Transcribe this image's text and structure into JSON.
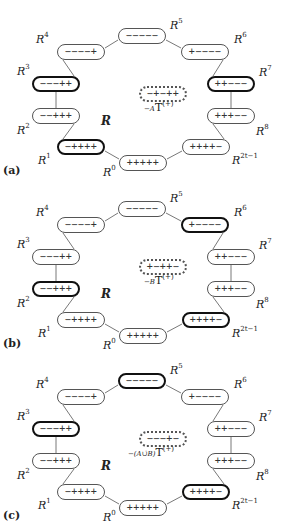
{
  "panels": [
    {
      "id": "a",
      "panel_label": "(a)",
      "center_label": "R",
      "target": {
        "signs": "−+−++",
        "subscript": "−A",
        "symbol": "T",
        "superscript": "(+)"
      },
      "nodes": {
        "R0": {
          "label": "R",
          "sup": "0",
          "signs": "+++++",
          "highlight": false
        },
        "R1": {
          "label": "R",
          "sup": "1",
          "signs": "−++++",
          "highlight": true
        },
        "R2": {
          "label": "R",
          "sup": "2",
          "signs": "−−+++",
          "highlight": false
        },
        "R3": {
          "label": "R",
          "sup": "3",
          "signs": "−−−++",
          "highlight": true
        },
        "R4": {
          "label": "R",
          "sup": "4",
          "signs": "−−−−+",
          "highlight": false
        },
        "R5": {
          "label": "R",
          "sup": "5",
          "signs": "−−−−−",
          "highlight": false
        },
        "R6": {
          "label": "R",
          "sup": "6",
          "signs": "+−−−−",
          "highlight": false
        },
        "R7": {
          "label": "R",
          "sup": "7",
          "signs": "++−−−",
          "highlight": true
        },
        "R8": {
          "label": "R",
          "sup": "8",
          "signs": "+++−−",
          "highlight": false
        },
        "R2t1": {
          "label": "R",
          "sup": "2t−1",
          "signs": "++++−",
          "highlight": false
        }
      }
    },
    {
      "id": "b",
      "panel_label": "(b)",
      "center_label": "R",
      "target": {
        "signs": "+−++−",
        "subscript": "−B",
        "symbol": "T",
        "superscript": "(+)"
      },
      "nodes": {
        "R0": {
          "label": "R",
          "sup": "0",
          "signs": "+++++",
          "highlight": false
        },
        "R1": {
          "label": "R",
          "sup": "1",
          "signs": "−++++",
          "highlight": false
        },
        "R2": {
          "label": "R",
          "sup": "2",
          "signs": "−−+++",
          "highlight": true
        },
        "R3": {
          "label": "R",
          "sup": "3",
          "signs": "−−−++",
          "highlight": false
        },
        "R4": {
          "label": "R",
          "sup": "4",
          "signs": "−−−−+",
          "highlight": false
        },
        "R5": {
          "label": "R",
          "sup": "5",
          "signs": "−−−−−",
          "highlight": false
        },
        "R6": {
          "label": "R",
          "sup": "6",
          "signs": "+−−−−",
          "highlight": true
        },
        "R7": {
          "label": "R",
          "sup": "7",
          "signs": "++−−−",
          "highlight": false
        },
        "R8": {
          "label": "R",
          "sup": "8",
          "signs": "+++−−",
          "highlight": false
        },
        "R2t1": {
          "label": "R",
          "sup": "2t−1",
          "signs": "++++−",
          "highlight": true
        }
      }
    },
    {
      "id": "c",
      "panel_label": "(c)",
      "center_label": "R",
      "target": {
        "signs": "−−−+−",
        "subscript": "−(A∪̇B)",
        "symbol": "T",
        "superscript": "(+)"
      },
      "nodes": {
        "R0": {
          "label": "R",
          "sup": "0",
          "signs": "+++++",
          "highlight": false
        },
        "R1": {
          "label": "R",
          "sup": "1",
          "signs": "−++++",
          "highlight": false
        },
        "R2": {
          "label": "R",
          "sup": "2",
          "signs": "−−+++",
          "highlight": false
        },
        "R3": {
          "label": "R",
          "sup": "3",
          "signs": "−−−++",
          "highlight": true
        },
        "R4": {
          "label": "R",
          "sup": "4",
          "signs": "−−−−+",
          "highlight": false
        },
        "R5": {
          "label": "R",
          "sup": "5",
          "signs": "−−−−−",
          "highlight": true
        },
        "R6": {
          "label": "R",
          "sup": "6",
          "signs": "+−−−−",
          "highlight": false
        },
        "R7": {
          "label": "R",
          "sup": "7",
          "signs": "++−−−",
          "highlight": false
        },
        "R8": {
          "label": "R",
          "sup": "8",
          "signs": "+++−−",
          "highlight": false
        },
        "R2t1": {
          "label": "R",
          "sup": "2t−1",
          "signs": "++++−",
          "highlight": true
        }
      }
    }
  ]
}
